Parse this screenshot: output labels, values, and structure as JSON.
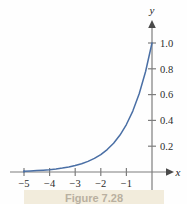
{
  "figure": {
    "caption": "Figure 7.28",
    "curve_color": "#4a6fa5",
    "axis_color": "#7d7d7d",
    "text_color": "#2b2b2b",
    "background_color": "#fefefe",
    "caption_band_color": "#f2ecdc"
  },
  "axes": {
    "x_name": "x",
    "y_name": "y"
  },
  "chart_data": {
    "type": "line",
    "title": "Figure 7.28",
    "subtitle": "",
    "xlabel": "x",
    "ylabel": "y",
    "xlim": [
      -5.35,
      0.6
    ],
    "ylim": [
      -0.08,
      1.12
    ],
    "grid": false,
    "legend": false,
    "legend_position": "none",
    "x_ticks": [
      -5,
      -4,
      -3,
      -2,
      -1
    ],
    "x_tick_labels": [
      "−5",
      "−4",
      "−3",
      "−2",
      "−1"
    ],
    "y_ticks": [
      0.2,
      0.4,
      0.6,
      0.8,
      1.0
    ],
    "y_tick_labels": [
      "0.2",
      "0.4",
      "0.6",
      "0.8",
      "1.0"
    ],
    "series": [
      {
        "name": "y = e^x",
        "color": "#4a6fa5",
        "x": [
          -5.0,
          -4.75,
          -4.5,
          -4.25,
          -4.0,
          -3.75,
          -3.5,
          -3.25,
          -3.0,
          -2.75,
          -2.5,
          -2.25,
          -2.0,
          -1.75,
          -1.5,
          -1.25,
          -1.0,
          -0.75,
          -0.5,
          -0.25,
          0.0
        ],
        "values": [
          0.0067,
          0.0087,
          0.0111,
          0.0143,
          0.0183,
          0.0235,
          0.0302,
          0.0388,
          0.0498,
          0.0639,
          0.0821,
          0.1054,
          0.1353,
          0.1738,
          0.2231,
          0.2865,
          0.3679,
          0.4724,
          0.6065,
          0.7788,
          1.0
        ]
      }
    ],
    "annotations": []
  }
}
